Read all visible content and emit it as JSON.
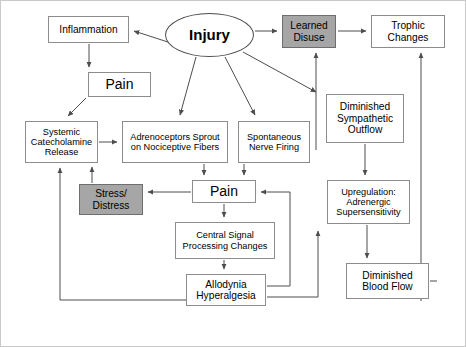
{
  "diagram": {
    "outer_border_color": "#c9c9c9",
    "shaded_fill": "#a6a6a6",
    "box_stroke": "#8c8c8c",
    "arrow_color": "#4d4d4d",
    "nodes": [
      {
        "id": "inflammation",
        "label": "Inflammation",
        "shape": "rect",
        "shaded": false,
        "x": 48,
        "y": 16,
        "w": 81,
        "h": 27,
        "size": "t-md"
      },
      {
        "id": "injury",
        "label": "Injury",
        "shape": "ellipse",
        "shaded": false,
        "x": 165,
        "y": 13,
        "w": 89,
        "h": 44,
        "size": "t-xl"
      },
      {
        "id": "learned-disuse",
        "label": "Learned\nDisuse",
        "shape": "rect",
        "shaded": true,
        "x": 282,
        "y": 15,
        "w": 54,
        "h": 33,
        "size": "t-md"
      },
      {
        "id": "trophic-changes",
        "label": "Trophic\nChanges",
        "shape": "rect",
        "shaded": false,
        "x": 371,
        "y": 15,
        "w": 74,
        "h": 33,
        "size": "t-md"
      },
      {
        "id": "pain-top",
        "label": "Pain",
        "shape": "rect",
        "shaded": false,
        "x": 88,
        "y": 72,
        "w": 63,
        "h": 25,
        "size": "t-lg"
      },
      {
        "id": "dim-symp",
        "label": "Diminished\nSympathetic\nOutflow",
        "shape": "rect",
        "shaded": false,
        "x": 326,
        "y": 94,
        "w": 78,
        "h": 49,
        "size": "t-md"
      },
      {
        "id": "systemic-cat",
        "label": "Systemic\nCatecholamine\nRelease",
        "shape": "rect",
        "shaded": false,
        "x": 25,
        "y": 121,
        "w": 73,
        "h": 42,
        "size": "t-sm"
      },
      {
        "id": "adrenoceptors",
        "label": "Adrenoceptors Sprout\non Nociceptive Fibers",
        "shape": "rect",
        "shaded": false,
        "x": 122,
        "y": 121,
        "w": 106,
        "h": 42,
        "size": "t-sm"
      },
      {
        "id": "spontaneous",
        "label": "Spontaneous\nNerve Firing",
        "shape": "rect",
        "shaded": false,
        "x": 238,
        "y": 121,
        "w": 72,
        "h": 42,
        "size": "t-sm"
      },
      {
        "id": "stress-distress",
        "label": "Stress/\nDistress",
        "shape": "rect",
        "shaded": true,
        "x": 79,
        "y": 184,
        "w": 64,
        "h": 31,
        "size": "t-md"
      },
      {
        "id": "pain-mid",
        "label": "Pain",
        "shape": "rect",
        "shaded": false,
        "x": 192,
        "y": 180,
        "w": 64,
        "h": 23,
        "size": "t-lg"
      },
      {
        "id": "upregulation",
        "label": "Upregulation:\nAdrenergic\nSupersensitivity",
        "shape": "rect",
        "shaded": false,
        "x": 327,
        "y": 180,
        "w": 83,
        "h": 44,
        "size": "t-sm"
      },
      {
        "id": "central-signal",
        "label": "Central Signal\nProcessing Changes",
        "shape": "rect",
        "shaded": false,
        "x": 175,
        "y": 222,
        "w": 100,
        "h": 37,
        "size": "t-sm"
      },
      {
        "id": "dim-blood",
        "label": "Diminished\nBlood Flow",
        "shape": "rect",
        "shaded": false,
        "x": 346,
        "y": 263,
        "w": 83,
        "h": 36,
        "size": "t-md"
      },
      {
        "id": "allodynia",
        "label": "Allodynia\nHyperalgesia",
        "shape": "rect",
        "shaded": false,
        "x": 186,
        "y": 274,
        "w": 80,
        "h": 32,
        "size": "t-md"
      }
    ],
    "edges": [
      {
        "id": "injury-to-inflammation",
        "from": "injury",
        "to": "inflammation"
      },
      {
        "id": "injury-to-learned-disuse",
        "from": "injury",
        "to": "learned-disuse"
      },
      {
        "id": "injury-to-adrenoceptors",
        "from": "injury",
        "to": "adrenoceptors"
      },
      {
        "id": "injury-to-spontaneous",
        "from": "injury",
        "to": "spontaneous"
      },
      {
        "id": "injury-to-right-riser",
        "from": "injury",
        "to": "learned-disuse-riser"
      },
      {
        "id": "inflammation-to-pain-top",
        "from": "inflammation",
        "to": "pain-top"
      },
      {
        "id": "pain-top-to-systemic",
        "from": "pain-top",
        "to": "systemic-cat"
      },
      {
        "id": "systemic-to-adrenoceptors",
        "from": "systemic-cat",
        "to": "adrenoceptors"
      },
      {
        "id": "adrenoceptors-to-pain-mid",
        "from": "adrenoceptors",
        "to": "pain-mid"
      },
      {
        "id": "spontaneous-to-pain-mid",
        "from": "spontaneous",
        "to": "pain-mid"
      },
      {
        "id": "pain-mid-to-stress",
        "from": "pain-mid",
        "to": "stress-distress"
      },
      {
        "id": "stress-to-systemic",
        "from": "stress-distress",
        "to": "systemic-cat"
      },
      {
        "id": "pain-mid-to-central-signal",
        "from": "pain-mid",
        "to": "central-signal"
      },
      {
        "id": "central-signal-to-allodynia",
        "from": "central-signal",
        "to": "allodynia"
      },
      {
        "id": "allodynia-to-pain-mid",
        "from": "allodynia",
        "to": "pain-mid"
      },
      {
        "id": "allodynia-to-upregulation",
        "from": "allodynia",
        "to": "upregulation"
      },
      {
        "id": "allodynia-to-systemic-loop",
        "from": "allodynia",
        "to": "systemic-cat"
      },
      {
        "id": "learned-disuse-to-trophic",
        "from": "learned-disuse",
        "to": "trophic-changes"
      },
      {
        "id": "dim-symp-to-upregulation",
        "from": "dim-symp",
        "to": "upregulation"
      },
      {
        "id": "upregulation-to-dim-blood",
        "from": "upregulation",
        "to": "dim-blood"
      },
      {
        "id": "dim-blood-riser-to-trophic",
        "from": "dim-blood",
        "to": "trophic-changes"
      },
      {
        "id": "riser-to-learned-disuse",
        "from": "dim-symp",
        "to": "learned-disuse"
      }
    ]
  }
}
